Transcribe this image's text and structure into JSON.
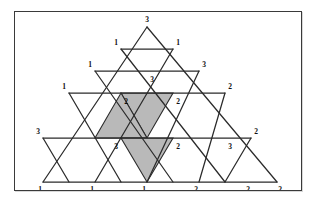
{
  "figure": {
    "name": "sperner-labelled-triangulation",
    "frame": {
      "border_color": "#3a3a3a",
      "background": "#ffffff"
    },
    "line_color": "#2b2b2b",
    "shade_color": "#b9b9b9",
    "rows": 6,
    "vertex_labels": [
      {
        "id": "v-r0-c0",
        "row": 0,
        "col": 0,
        "label": "3",
        "x": 168,
        "y": 24
      },
      {
        "id": "v-r1-c0",
        "row": 1,
        "col": 0,
        "label": "1",
        "x": 141,
        "y": 62
      },
      {
        "id": "v-r1-c1",
        "row": 1,
        "col": 1,
        "label": "1",
        "x": 194,
        "y": 62
      },
      {
        "id": "v-r2-c0",
        "row": 2,
        "col": 0,
        "label": "1",
        "x": 114,
        "y": 89
      },
      {
        "id": "v-r2-c1",
        "row": 2,
        "col": 1,
        "label": "3",
        "x": 173,
        "y": 99
      },
      {
        "id": "v-r2-c2",
        "row": 2,
        "col": 2,
        "label": "3",
        "x": 219,
        "y": 89
      },
      {
        "id": "v-r3-c0",
        "row": 3,
        "col": 0,
        "label": "1",
        "x": 88,
        "y": 116
      },
      {
        "id": "v-r3-c1",
        "row": 3,
        "col": 1,
        "label": "2",
        "x": 147,
        "y": 126
      },
      {
        "id": "v-r3-c2",
        "row": 3,
        "col": 2,
        "label": "2",
        "x": 179,
        "y": 126
      },
      {
        "id": "v-r3-c3",
        "row": 3,
        "col": 3,
        "label": "2",
        "x": 245,
        "y": 116
      },
      {
        "id": "v-r4-c0",
        "row": 4,
        "col": 0,
        "label": "3",
        "x": 61,
        "y": 143
      },
      {
        "id": "v-r4-c1",
        "row": 4,
        "col": 1,
        "label": "3",
        "x": 120,
        "y": 153
      },
      {
        "id": "v-r4-c2",
        "row": 4,
        "col": 2,
        "label": "2",
        "x": 153,
        "y": 153
      },
      {
        "id": "v-r4-c3",
        "row": 4,
        "col": 3,
        "label": "3",
        "x": 199,
        "y": 153
      },
      {
        "id": "v-r4-c4",
        "row": 4,
        "col": 4,
        "label": "2",
        "x": 246,
        "y": 143
      },
      {
        "id": "v-r5-c0",
        "row": 5,
        "col": 0,
        "label": "1",
        "x": 38,
        "y": 184
      },
      {
        "id": "v-r5-c1",
        "row": 5,
        "col": 1,
        "label": "1",
        "x": 90,
        "y": 184
      },
      {
        "id": "v-r5-c2",
        "row": 5,
        "col": 2,
        "label": "1",
        "x": 134,
        "y": 184
      },
      {
        "id": "v-r5-c3",
        "row": 5,
        "col": 3,
        "label": "2",
        "x": 180,
        "y": 184
      },
      {
        "id": "v-r5-c4",
        "row": 5,
        "col": 4,
        "label": "2",
        "x": 224,
        "y": 184
      },
      {
        "id": "v-r5-c5",
        "row": 5,
        "col": 5,
        "label": "2",
        "x": 272,
        "y": 184
      }
    ],
    "shaded_cells": [
      {
        "id": "shaded-row2-down",
        "row": 2,
        "orientation": "down",
        "points": "120,92 172,92 146,137"
      },
      {
        "id": "shaded-row3-up",
        "row": 3,
        "orientation": "up",
        "points": "120,137 146,92 172,137"
      },
      {
        "id": "shaded-row5-down",
        "row": 5,
        "orientation": "down",
        "points": "120,137 172,137 146,181"
      }
    ]
  }
}
